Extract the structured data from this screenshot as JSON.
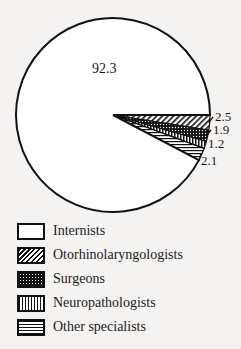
{
  "chart_data": {
    "type": "pie",
    "title": "",
    "categories": [
      "Internists",
      "Otorhinolaryngologists",
      "Surgeons",
      "Neuropathologists",
      "Other specialists"
    ],
    "values": [
      92.3,
      2.5,
      1.9,
      1.2,
      2.1
    ],
    "labels": [
      "92.3",
      "2.5",
      "1.9",
      "1.2",
      "2.1"
    ],
    "patterns": [
      "blank",
      "diagonal-hatch",
      "dots",
      "vertical-lines",
      "horizontal-lines"
    ],
    "legend_position": "bottom-left",
    "start_angle_deg": 0,
    "direction": "clockwise"
  },
  "legend": {
    "items": [
      {
        "label": "Internists"
      },
      {
        "label": "Otorhinolaryngologists"
      },
      {
        "label": "Surgeons"
      },
      {
        "label": "Neuropathologists"
      },
      {
        "label": "Other specialists"
      }
    ]
  }
}
